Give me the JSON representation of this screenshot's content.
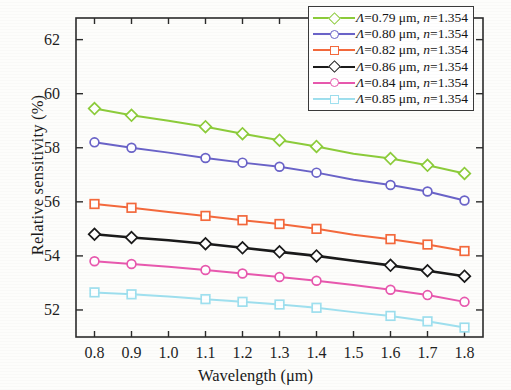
{
  "chart_data": {
    "type": "line",
    "title": "",
    "xlabel": "Wavelength (μm)",
    "ylabel": "Relative sensitivity (%)",
    "xlim": [
      0.75,
      1.85
    ],
    "ylim": [
      51.0,
      62.8
    ],
    "xticks": [
      "0.8",
      "0.9",
      "1.0",
      "1.1",
      "1.2",
      "1.3",
      "1.4",
      "1.5",
      "1.6",
      "1.7",
      "1.8"
    ],
    "xtick_values": [
      0.8,
      0.9,
      1.0,
      1.1,
      1.2,
      1.3,
      1.4,
      1.5,
      1.6,
      1.7,
      1.8
    ],
    "yticks": [
      "52",
      "54",
      "56",
      "58",
      "60",
      "62"
    ],
    "ytick_values": [
      52,
      54,
      56,
      58,
      60,
      62
    ],
    "grid": false,
    "legend_position": "top-right",
    "x": [
      0.8,
      0.9,
      1.0,
      1.1,
      1.2,
      1.3,
      1.4,
      1.5,
      1.6,
      1.7,
      1.8
    ],
    "series": [
      {
        "name": "Λ=0.79 μm, n=1.354",
        "lambda": "0.79",
        "n": "1.354",
        "color": "#8ccc3a",
        "marker": "diamond",
        "values": [
          59.45,
          59.2,
          59.0,
          58.78,
          58.52,
          58.28,
          58.05,
          57.78,
          57.6,
          57.35,
          57.05
        ]
      },
      {
        "name": "Λ=0.80 μm, n=1.354",
        "lambda": "0.80",
        "n": "1.354",
        "color": "#6a63c8",
        "marker": "circle",
        "values": [
          58.2,
          58.0,
          57.82,
          57.62,
          57.45,
          57.3,
          57.08,
          56.82,
          56.62,
          56.38,
          56.05
        ]
      },
      {
        "name": "Λ=0.82 μm, n=1.354",
        "lambda": "0.82",
        "n": "1.354",
        "color": "#f4693c",
        "marker": "square",
        "values": [
          55.92,
          55.78,
          55.62,
          55.48,
          55.32,
          55.18,
          55.0,
          54.78,
          54.62,
          54.42,
          54.18
        ]
      },
      {
        "name": "Λ=0.86 μm, n=1.354",
        "lambda": "0.86",
        "n": "1.354",
        "color": "#1a1a1a",
        "marker": "diamond",
        "values": [
          54.8,
          54.68,
          54.58,
          54.45,
          54.3,
          54.15,
          54.0,
          53.82,
          53.65,
          53.45,
          53.25
        ]
      },
      {
        "name": "Λ=0.84 μm, n=1.354",
        "lambda": "0.84",
        "n": "1.354",
        "color": "#e858ae",
        "marker": "circle",
        "values": [
          53.8,
          53.7,
          53.6,
          53.48,
          53.35,
          53.22,
          53.08,
          52.92,
          52.75,
          52.55,
          52.3
        ]
      },
      {
        "name": "Λ=0.85 μm, n=1.354",
        "lambda": "0.85",
        "n": "1.354",
        "color": "#9fe0ef",
        "marker": "square",
        "values": [
          52.65,
          52.58,
          52.5,
          52.4,
          52.3,
          52.2,
          52.08,
          51.92,
          51.78,
          51.58,
          51.35
        ]
      }
    ]
  },
  "axis": {
    "ylabel": "Relative sensitivity (%)",
    "xlabel": "Wavelength (μm)"
  },
  "legend": {
    "rows": [
      {
        "lam": "Λ=0.79 μm, ",
        "nval": "n",
        "eq": "=1.354"
      },
      {
        "lam": "Λ=0.80 μm, ",
        "nval": "n",
        "eq": "=1.354"
      },
      {
        "lam": "Λ=0.82 μm, ",
        "nval": "n",
        "eq": "=1.354"
      },
      {
        "lam": "Λ=0.86 μm, ",
        "nval": "n",
        "eq": "=1.354"
      },
      {
        "lam": "Λ=0.84 μm, ",
        "nval": "n",
        "eq": "=1.354"
      },
      {
        "lam": "Λ=0.85 μm, ",
        "nval": "n",
        "eq": "=1.354"
      }
    ]
  }
}
